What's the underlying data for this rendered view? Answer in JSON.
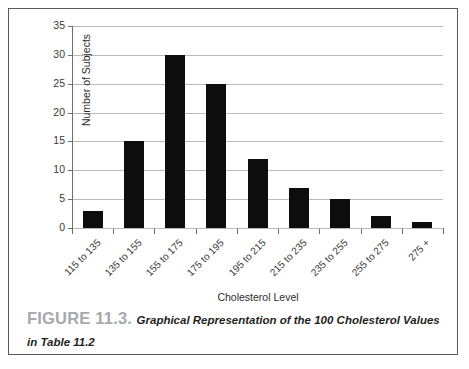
{
  "figure": {
    "caption_label": "FIGURE 11.3.",
    "caption_text": "Graphical Representation of the 100 Cholesterol Values in Table 11.2"
  },
  "chart_data": {
    "type": "bar",
    "title": "",
    "categories": [
      "115 to 135",
      "135 to 155",
      "155 to 175",
      "175 to 195",
      "195 to 215",
      "215 to 235",
      "235 to 255",
      "255 to 275",
      "275 +"
    ],
    "values": [
      3,
      15,
      30,
      25,
      12,
      7,
      5,
      2,
      1
    ],
    "xlabel": "Cholesterol Level",
    "ylabel": "Number of Subjects",
    "ylim": [
      0,
      35
    ],
    "yticks": [
      0,
      5,
      10,
      15,
      20,
      25,
      30,
      35
    ],
    "ytick_labels": [
      "0",
      "5",
      "10",
      "15",
      "20",
      "25",
      "30",
      "35"
    ],
    "grid": "horizontal",
    "legend": "none",
    "bar_color": "#0d0d0d",
    "gridline_color": "#b9b9b9",
    "axis_color": "#6d6e70"
  }
}
